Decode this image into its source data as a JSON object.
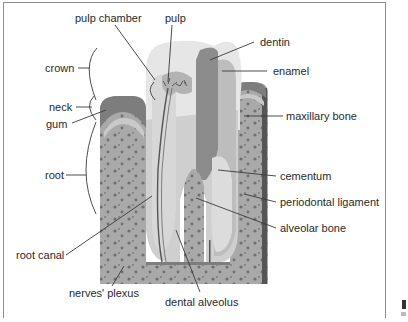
{
  "diagram": {
    "colors": {
      "background": "#ffffff",
      "frame": "#8e8e8e",
      "enamel": "#d9d9d9",
      "enamel_light": "#ececec",
      "dentin": "#bdbdbd",
      "dentin_dark": "#8c8c8c",
      "pulp": "#b3b3b3",
      "gum": "#7d7d7d",
      "bone": "#a9a9a9",
      "bone_dots": "#6f6f6f",
      "ligament": "#c9c9c9",
      "leader": "#3a3a3a",
      "text": "#2a2a2a"
    },
    "labels": {
      "pulp_chamber": "pulp chamber",
      "pulp": "pulp",
      "dentin": "dentin",
      "enamel": "enamel",
      "crown": "crown",
      "neck": "neck",
      "gum": "gum",
      "maxillary_bone": "maxillary bone",
      "root": "root",
      "cementum": "cementum",
      "periodontal_ligament": "periodontal ligament",
      "alveolar_bone": "alveolar bone",
      "root_canal": "root canal",
      "nerves_plexus": "nerves' plexus",
      "dental_alveolus": "dental alveolus"
    }
  }
}
